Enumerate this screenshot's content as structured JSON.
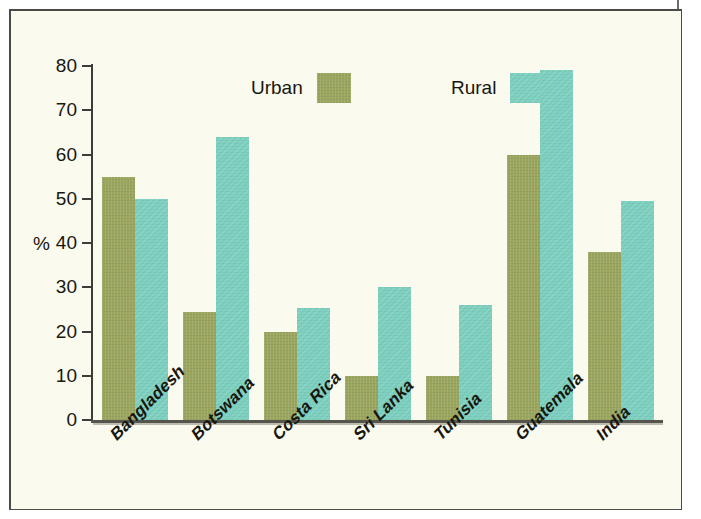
{
  "chart_data": {
    "type": "bar",
    "title": "",
    "subtitle": "",
    "xlabel": "",
    "ylabel": "%",
    "ylim": [
      0,
      80
    ],
    "yticks": [
      0,
      10,
      20,
      30,
      40,
      50,
      60,
      70,
      80
    ],
    "ytick_labels": [
      "0",
      "10",
      "20",
      "30",
      "40",
      "50",
      "60",
      "70",
      "80"
    ],
    "grid": false,
    "legend_position": "top-center",
    "categories": [
      "Bangladesh",
      "Botswana",
      "Costa Rica",
      "Sri Lanka",
      "Tunisia",
      "Guatemala",
      "India"
    ],
    "series": [
      {
        "name": "Urban",
        "color": "#9aa55e",
        "values": [
          55,
          24.5,
          20,
          10,
          10,
          60,
          38
        ]
      },
      {
        "name": "Rural",
        "color": "#7ccfbe",
        "values": [
          50,
          64,
          25.3,
          30,
          26,
          79,
          49.5
        ]
      }
    ]
  },
  "figure": {
    "background_color": "#fbfaee",
    "frame_color": "#4a4a46",
    "axis_color": "#3c3c38",
    "text_color": "#17170f"
  }
}
